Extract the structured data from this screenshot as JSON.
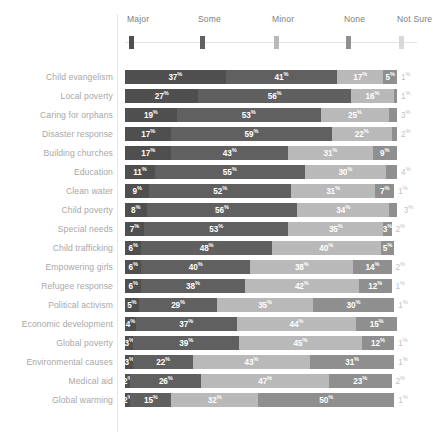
{
  "chart_data": {
    "type": "bar",
    "title": "",
    "subtitle": "",
    "xlabel": "",
    "ylabel": "",
    "orientation": "horizontal",
    "stacked": true,
    "normalized_percent": true,
    "grid": false,
    "legend_position": "top",
    "xlim": [
      0,
      100
    ],
    "value_suffix": "%",
    "legend_entries": [
      "Major",
      "Some",
      "Minor",
      "None",
      "Not Sure"
    ],
    "series_names": [
      "Major",
      "Some",
      "Minor",
      "None",
      "Not Sure"
    ],
    "colors": {
      "Major": "#4f4f4f",
      "Some": "#606060",
      "Minor": "#b9b9b9",
      "None": "#8f8f8f",
      "Not Sure": "#d8d8d8",
      "label_text": "#a8a8a8",
      "legend_text": "#7d7d7d",
      "value_text": "#ffffff",
      "tail_text": "#c2c2c2",
      "divider": "#e8e8e8",
      "legend_track": "#e3e3e3",
      "background": "#ffffff"
    },
    "categories": [
      "Child evangelism",
      "Local poverty",
      "Caring for orphans",
      "Disaster response",
      "Building churches",
      "Education",
      "Clean water",
      "Child poverty",
      "Special needs",
      "Child trafficking",
      "Empowering girls",
      "Refugee response",
      "Political activism",
      "Economic development",
      "Global poverty",
      "Environmental causes",
      "Medical aid",
      "Global warming"
    ],
    "series": [
      {
        "name": "Major",
        "values": [
          37,
          27,
          19,
          17,
          17,
          11,
          9,
          8,
          7,
          6,
          6,
          6,
          5,
          4,
          3,
          3,
          2,
          2
        ]
      },
      {
        "name": "Some",
        "values": [
          41,
          56,
          53,
          59,
          43,
          55,
          52,
          56,
          53,
          48,
          40,
          38,
          29,
          37,
          39,
          22,
          26,
          15
        ]
      },
      {
        "name": "Minor",
        "values": [
          17,
          16,
          25,
          22,
          31,
          30,
          31,
          34,
          35,
          40,
          38,
          42,
          35,
          44,
          45,
          43,
          47,
          32
        ]
      },
      {
        "name": "None",
        "values": [
          5,
          1,
          3,
          2,
          9,
          4,
          7,
          3,
          3,
          5,
          14,
          12,
          30,
          15,
          12,
          31,
          23,
          50
        ]
      },
      {
        "name": "Not Sure",
        "values": [
          1,
          1,
          1,
          1,
          0,
          1,
          1,
          1,
          2,
          0,
          2,
          1,
          1,
          0,
          1,
          1,
          2,
          1
        ]
      }
    ],
    "rows": [
      {
        "label": "Child evangelism",
        "segments": [
          {
            "name": "Major",
            "value": 37,
            "label": "37"
          },
          {
            "name": "Some",
            "value": 41,
            "label": "41"
          },
          {
            "name": "Minor",
            "value": 17,
            "label": "17"
          },
          {
            "name": "None",
            "value": 5,
            "label": "5"
          }
        ],
        "tail": "1"
      },
      {
        "label": "Local poverty",
        "segments": [
          {
            "name": "Major",
            "value": 27,
            "label": "27"
          },
          {
            "name": "Some",
            "value": 56,
            "label": "56"
          },
          {
            "name": "Minor",
            "value": 16,
            "label": "16"
          },
          {
            "name": "None",
            "value": 1,
            "label": ""
          }
        ],
        "tail": "1"
      },
      {
        "label": "Caring for orphans",
        "segments": [
          {
            "name": "Major",
            "value": 19,
            "label": "19"
          },
          {
            "name": "Some",
            "value": 53,
            "label": "53"
          },
          {
            "name": "Minor",
            "value": 25,
            "label": "25"
          },
          {
            "name": "None",
            "value": 3,
            "label": ""
          }
        ],
        "tail": "3"
      },
      {
        "label": "Disaster response",
        "segments": [
          {
            "name": "Major",
            "value": 17,
            "label": "17"
          },
          {
            "name": "Some",
            "value": 59,
            "label": "59"
          },
          {
            "name": "Minor",
            "value": 22,
            "label": "22"
          },
          {
            "name": "None",
            "value": 2,
            "label": ""
          }
        ],
        "tail": "2"
      },
      {
        "label": "Building churches",
        "segments": [
          {
            "name": "Major",
            "value": 17,
            "label": "17"
          },
          {
            "name": "Some",
            "value": 43,
            "label": "43"
          },
          {
            "name": "Minor",
            "value": 31,
            "label": "31"
          },
          {
            "name": "None",
            "value": 9,
            "label": "9"
          }
        ],
        "tail": ""
      },
      {
        "label": "Education",
        "segments": [
          {
            "name": "Major",
            "value": 11,
            "label": "11"
          },
          {
            "name": "Some",
            "value": 55,
            "label": "55"
          },
          {
            "name": "Minor",
            "value": 30,
            "label": "30"
          },
          {
            "name": "None",
            "value": 4,
            "label": ""
          }
        ],
        "tail": "4"
      },
      {
        "label": "Clean water",
        "segments": [
          {
            "name": "Major",
            "value": 9,
            "label": "9"
          },
          {
            "name": "Some",
            "value": 52,
            "label": "52"
          },
          {
            "name": "Minor",
            "value": 31,
            "label": "31"
          },
          {
            "name": "None",
            "value": 7,
            "label": "7"
          }
        ],
        "tail": "1"
      },
      {
        "label": "Child poverty",
        "segments": [
          {
            "name": "Major",
            "value": 8,
            "label": "8"
          },
          {
            "name": "Some",
            "value": 56,
            "label": "56"
          },
          {
            "name": "Minor",
            "value": 34,
            "label": "34"
          },
          {
            "name": "None",
            "value": 3,
            "label": ""
          }
        ],
        "tail": "3"
      },
      {
        "label": "Special needs",
        "segments": [
          {
            "name": "Major",
            "value": 7,
            "label": "7"
          },
          {
            "name": "Some",
            "value": 53,
            "label": "53"
          },
          {
            "name": "Minor",
            "value": 35,
            "label": "35"
          },
          {
            "name": "None",
            "value": 3,
            "label": "3"
          }
        ],
        "tail": "2"
      },
      {
        "label": "Child trafficking",
        "segments": [
          {
            "name": "Major",
            "value": 6,
            "label": "6"
          },
          {
            "name": "Some",
            "value": 48,
            "label": "48"
          },
          {
            "name": "Minor",
            "value": 40,
            "label": "40"
          },
          {
            "name": "None",
            "value": 5,
            "label": "5"
          }
        ],
        "tail": ""
      },
      {
        "label": "Empowering girls",
        "segments": [
          {
            "name": "Major",
            "value": 6,
            "label": "6"
          },
          {
            "name": "Some",
            "value": 40,
            "label": "40"
          },
          {
            "name": "Minor",
            "value": 38,
            "label": "38"
          },
          {
            "name": "None",
            "value": 14,
            "label": "14"
          }
        ],
        "tail": "2"
      },
      {
        "label": "Refugee response",
        "segments": [
          {
            "name": "Major",
            "value": 6,
            "label": "6"
          },
          {
            "name": "Some",
            "value": 38,
            "label": "38"
          },
          {
            "name": "Minor",
            "value": 42,
            "label": "42"
          },
          {
            "name": "None",
            "value": 12,
            "label": "12"
          }
        ],
        "tail": "1"
      },
      {
        "label": "Political activism",
        "segments": [
          {
            "name": "Major",
            "value": 5,
            "label": "5"
          },
          {
            "name": "Some",
            "value": 29,
            "label": "29"
          },
          {
            "name": "Minor",
            "value": 35,
            "label": "35"
          },
          {
            "name": "None",
            "value": 30,
            "label": "30"
          }
        ],
        "tail": "1"
      },
      {
        "label": "Economic development",
        "segments": [
          {
            "name": "Major",
            "value": 4,
            "label": "4"
          },
          {
            "name": "Some",
            "value": 37,
            "label": "37"
          },
          {
            "name": "Minor",
            "value": 44,
            "label": "44"
          },
          {
            "name": "None",
            "value": 15,
            "label": "15"
          }
        ],
        "tail": ""
      },
      {
        "label": "Global poverty",
        "segments": [
          {
            "name": "Major",
            "value": 3,
            "label": "3"
          },
          {
            "name": "Some",
            "value": 39,
            "label": "39"
          },
          {
            "name": "Minor",
            "value": 45,
            "label": "45"
          },
          {
            "name": "None",
            "value": 12,
            "label": "12"
          }
        ],
        "tail": "1"
      },
      {
        "label": "Environmental causes",
        "segments": [
          {
            "name": "Major",
            "value": 3,
            "label": "3"
          },
          {
            "name": "Some",
            "value": 22,
            "label": "22"
          },
          {
            "name": "Minor",
            "value": 43,
            "label": "43"
          },
          {
            "name": "None",
            "value": 31,
            "label": "31"
          }
        ],
        "tail": "1"
      },
      {
        "label": "Medical aid",
        "segments": [
          {
            "name": "Major",
            "value": 2,
            "label": "2"
          },
          {
            "name": "Some",
            "value": 26,
            "label": "26"
          },
          {
            "name": "Minor",
            "value": 47,
            "label": "47"
          },
          {
            "name": "None",
            "value": 23,
            "label": "23"
          }
        ],
        "tail": "2"
      },
      {
        "label": "Global warming",
        "segments": [
          {
            "name": "Major",
            "value": 2,
            "label": "2"
          },
          {
            "name": "Some",
            "value": 15,
            "label": "15"
          },
          {
            "name": "Minor",
            "value": 32,
            "label": "32"
          },
          {
            "name": "None",
            "value": 50,
            "label": "50"
          }
        ],
        "tail": "1"
      }
    ]
  },
  "legend": {
    "items": [
      {
        "label": "Major",
        "color": "#4f4f4f",
        "x": 2
      },
      {
        "label": "Some",
        "color": "#606060",
        "x": 73
      },
      {
        "label": "Minor",
        "color": "#b9b9b9",
        "x": 147
      },
      {
        "label": "None",
        "color": "#8f8f8f",
        "x": 219
      },
      {
        "label": "Not Sure",
        "color": "#d8d8d8",
        "x": 272
      }
    ]
  }
}
